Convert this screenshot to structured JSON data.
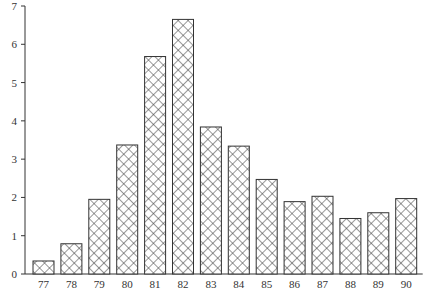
{
  "chart_data": {
    "type": "bar",
    "title": "",
    "xlabel": "",
    "ylabel": "",
    "categories": [
      "77",
      "78",
      "79",
      "80",
      "81",
      "82",
      "83",
      "84",
      "85",
      "86",
      "87",
      "88",
      "89",
      "90"
    ],
    "values": [
      0.34,
      0.79,
      1.95,
      3.37,
      5.68,
      6.65,
      3.84,
      3.34,
      2.47,
      1.89,
      2.03,
      1.45,
      1.6,
      1.97
    ],
    "ylim": [
      0,
      7
    ],
    "yticks": [
      0,
      1,
      2,
      3,
      4,
      5,
      6,
      7
    ],
    "grid": false,
    "legend": null,
    "bar_fill": "crosshatch",
    "bar_stroke": "#333333"
  }
}
